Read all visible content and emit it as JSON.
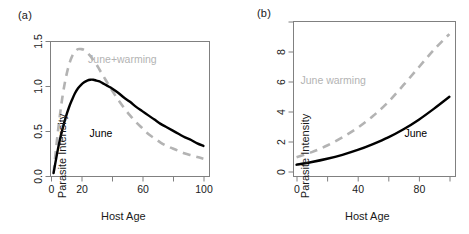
{
  "figure": {
    "width": 469,
    "height": 234,
    "background": "#ffffff"
  },
  "style": {
    "june_color": "#000000",
    "warming_color": "#b3b3b3",
    "axis_color": "#808080",
    "text_color": "#1a1a1a"
  },
  "panels": [
    {
      "id": "a",
      "label": "(a)",
      "xlabel": "Host Age",
      "ylabel": "Parasite Intensity",
      "xticks": [
        0,
        20,
        40,
        60,
        80,
        100
      ],
      "xtick_labels": [
        "0",
        "20",
        "",
        "60",
        "",
        "100"
      ],
      "yticks": [
        0.0,
        0.5,
        1.0,
        1.5
      ],
      "ytick_labels": [
        "0.0",
        "0.5",
        "1.0",
        "1.5"
      ],
      "xlim": [
        0,
        104
      ],
      "ylim": [
        -0.04,
        1.55
      ],
      "series": [
        {
          "name": "June",
          "label": "June",
          "style": "solid",
          "color": "#000000",
          "label_x": 33,
          "label_y": 0.42,
          "x": [
            2,
            4,
            6,
            8,
            10,
            12,
            14,
            16,
            18,
            20,
            22,
            24,
            26,
            28,
            30,
            32,
            34,
            36,
            38,
            40,
            44,
            48,
            52,
            56,
            60,
            64,
            68,
            72,
            76,
            80,
            84,
            88,
            92,
            96,
            100
          ],
          "y": [
            0.0,
            0.2,
            0.38,
            0.53,
            0.66,
            0.77,
            0.86,
            0.94,
            1.0,
            1.04,
            1.07,
            1.09,
            1.1,
            1.1,
            1.09,
            1.08,
            1.06,
            1.04,
            1.02,
            1.0,
            0.95,
            0.89,
            0.84,
            0.78,
            0.73,
            0.68,
            0.63,
            0.58,
            0.54,
            0.5,
            0.46,
            0.42,
            0.39,
            0.35,
            0.32
          ]
        },
        {
          "name": "June+warming",
          "label": "June+warming",
          "style": "dashed",
          "color": "#b3b3b3",
          "label_x": 47,
          "label_y": 1.3,
          "x": [
            2,
            4,
            6,
            8,
            10,
            12,
            14,
            16,
            18,
            20,
            22,
            24,
            26,
            28,
            30,
            32,
            34,
            36,
            38,
            40,
            44,
            48,
            52,
            56,
            60,
            64,
            68,
            72,
            76,
            80,
            84,
            88,
            92,
            96,
            100
          ],
          "y": [
            0.0,
            0.35,
            0.66,
            0.92,
            1.12,
            1.27,
            1.37,
            1.43,
            1.46,
            1.46,
            1.45,
            1.42,
            1.38,
            1.33,
            1.28,
            1.22,
            1.16,
            1.1,
            1.04,
            0.98,
            0.87,
            0.77,
            0.68,
            0.6,
            0.53,
            0.46,
            0.41,
            0.36,
            0.32,
            0.29,
            0.26,
            0.23,
            0.21,
            0.19,
            0.17
          ]
        }
      ]
    },
    {
      "id": "b",
      "label": "(b)",
      "xlabel": "Host Age",
      "ylabel": "Parasite Intensity",
      "xticks": [
        0,
        20,
        40,
        60,
        80,
        100
      ],
      "xtick_labels": [
        "0",
        "",
        "40",
        "",
        "80",
        ""
      ],
      "yticks": [
        0,
        2,
        4,
        6,
        8,
        10
      ],
      "ytick_labels": [
        "0",
        "2",
        "4",
        "6",
        "8",
        ""
      ],
      "xlim": [
        -2,
        104
      ],
      "ylim": [
        -0.3,
        10.2
      ],
      "series": [
        {
          "name": "June",
          "label": "June",
          "style": "solid",
          "color": "#000000",
          "label_x": 78,
          "label_y": 2.35,
          "x": [
            0,
            10,
            20,
            30,
            40,
            50,
            60,
            70,
            80,
            90,
            100
          ],
          "y": [
            0.5,
            0.68,
            0.9,
            1.17,
            1.5,
            1.9,
            2.35,
            2.9,
            3.55,
            4.3,
            5.1
          ]
        },
        {
          "name": "June warming",
          "label": "June warming",
          "style": "dashed",
          "color": "#b3b3b3",
          "label_x": 24,
          "label_y": 6.0,
          "x": [
            0,
            10,
            20,
            30,
            40,
            50,
            60,
            70,
            80,
            90,
            100
          ],
          "y": [
            1.0,
            1.35,
            1.8,
            2.35,
            3.0,
            3.8,
            4.75,
            5.9,
            7.1,
            8.3,
            9.35
          ]
        }
      ]
    }
  ]
}
